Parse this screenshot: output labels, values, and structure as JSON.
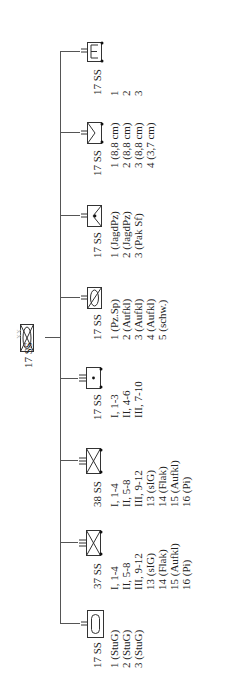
{
  "root": {
    "label": "17 SS",
    "symbol": "armored-infantry-division-icon",
    "echelon": "XX"
  },
  "branches": [
    {
      "id": "stug",
      "label": "17 SS",
      "echelon": "II",
      "symbol": "assault-gun-battalion-icon",
      "subunits": [
        "1 (StuG)",
        "2 (StuG)",
        "3 (StuG)"
      ]
    },
    {
      "id": "pzgren37",
      "label": "37 SS",
      "echelon": "III",
      "symbol": "motorized-infantry-regiment-icon",
      "subunits": [
        "I, 1-4",
        "II, 5-8",
        "III, 9-12",
        "13 (sIG)",
        "14 (Flak)",
        "15 (Aufkl)",
        "16 (Pi)"
      ]
    },
    {
      "id": "pzgren38",
      "label": "38 SS",
      "echelon": "III",
      "symbol": "motorized-infantry-regiment-icon",
      "subunits": [
        "I, 1-4",
        "II, 5-8",
        "III, 9-12",
        "13 (sIG)",
        "14 (Flak)",
        "15 (Aufkl)",
        "16 (Pi)"
      ]
    },
    {
      "id": "artillery",
      "label": "17 SS",
      "echelon": "III",
      "symbol": "artillery-regiment-icon",
      "subunits": [
        "I, 1-3",
        "II, 4-6",
        "III, 7-10"
      ]
    },
    {
      "id": "recon",
      "label": "17 SS",
      "echelon": "II",
      "symbol": "reconnaissance-battalion-icon",
      "subunits": [
        "1 (Pz.Sp)",
        "2 (Aufkl)",
        "3 (Aufkl)",
        "4 (Aufkl)",
        "5 (schw.)"
      ]
    },
    {
      "id": "antitank",
      "label": "17 SS",
      "echelon": "II",
      "symbol": "antitank-battalion-icon",
      "subunits": [
        "1 (JagdPz)",
        "2 (JagdPz)",
        "3 (Pak Sf)"
      ]
    },
    {
      "id": "flak",
      "label": "17 SS",
      "echelon": "II",
      "symbol": "antiaircraft-battalion-icon",
      "subunits": [
        "1 (8,8 cm)",
        "2 (8,8 cm)",
        "3 (8,8 cm)",
        "4 (3,7 cm)"
      ]
    },
    {
      "id": "engineer",
      "label": "17 SS",
      "echelon": "II",
      "symbol": "engineer-battalion-icon",
      "subunits": [
        "1",
        "2",
        "3"
      ]
    }
  ]
}
